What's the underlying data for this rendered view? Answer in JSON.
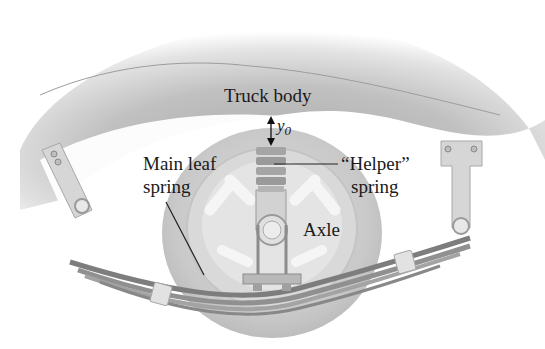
{
  "figure": {
    "labels": {
      "truck_body": "Truck body",
      "y0_symbol": "y",
      "y0_subscript": "0",
      "main_leaf_spring_line1": "Main leaf",
      "main_leaf_spring_line2": "spring",
      "helper_spring_line1": "“Helper”",
      "helper_spring_line2": "spring",
      "axle": "Axle"
    },
    "colors": {
      "body_shade": "#b9b9b9",
      "wheel_tire": "#cfcfcf",
      "wheel_rim": "#e2e2e2",
      "spring": "#8f8f8f",
      "bracket": "#d4d4d4",
      "text": "#1a1a1a"
    }
  }
}
